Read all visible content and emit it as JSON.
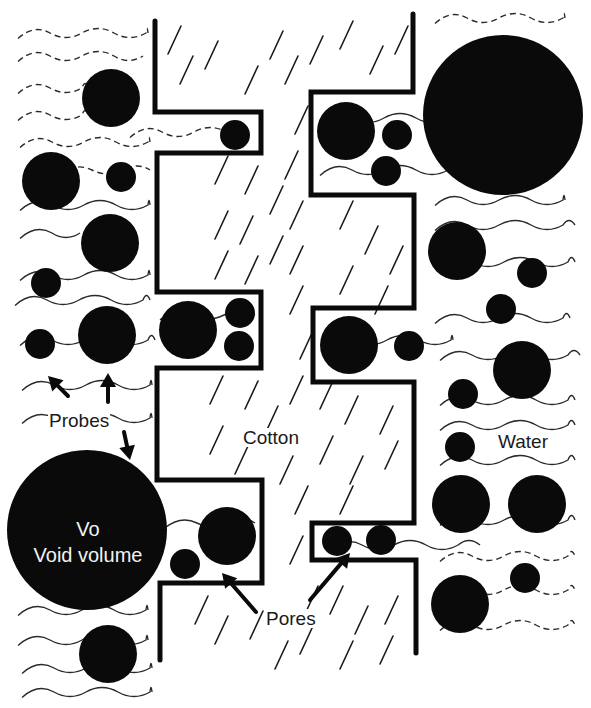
{
  "figure": {
    "width": 591,
    "height": 708,
    "background": "#ffffff",
    "ink_color": "#0a0a0a",
    "wave_color": "#2a2a2a",
    "hatch_color": "#1a1a1a"
  },
  "labels": {
    "probes": "Probes",
    "cotton": "Cotton",
    "water": "Water",
    "pores": "Pores",
    "void_title": "Vo",
    "void_subtitle": "Void volume"
  },
  "walls": [
    {
      "name": "left-cotton-wall",
      "points": [
        [
          155,
          21
        ],
        [
          155,
          112
        ],
        [
          261,
          112
        ],
        [
          261,
          153
        ],
        [
          157,
          153
        ],
        [
          157,
          292
        ],
        [
          261,
          292
        ],
        [
          261,
          368
        ],
        [
          157,
          368
        ],
        [
          157,
          480
        ],
        [
          262,
          480
        ],
        [
          262,
          583
        ],
        [
          160,
          583
        ],
        [
          160,
          660
        ]
      ]
    },
    {
      "name": "right-cotton-wall",
      "points": [
        [
          413,
          14
        ],
        [
          413,
          92
        ],
        [
          311,
          92
        ],
        [
          311,
          195
        ],
        [
          414,
          195
        ],
        [
          414,
          308
        ],
        [
          313,
          308
        ],
        [
          313,
          382
        ],
        [
          414,
          382
        ],
        [
          414,
          523
        ],
        [
          312,
          523
        ],
        [
          312,
          560
        ],
        [
          416,
          560
        ],
        [
          416,
          653
        ]
      ]
    }
  ],
  "circles": [
    {
      "cx": 111,
      "cy": 98,
      "r": 29,
      "region": "water-left"
    },
    {
      "cx": 51,
      "cy": 181,
      "r": 29,
      "region": "water-left"
    },
    {
      "cx": 121,
      "cy": 177,
      "r": 15,
      "region": "water-left"
    },
    {
      "cx": 110,
      "cy": 243,
      "r": 29,
      "region": "water-left"
    },
    {
      "cx": 46,
      "cy": 283,
      "r": 15,
      "region": "water-left"
    },
    {
      "cx": 40,
      "cy": 344,
      "r": 15,
      "region": "water-left"
    },
    {
      "cx": 107,
      "cy": 335,
      "r": 29,
      "region": "water-left"
    },
    {
      "cx": 87,
      "cy": 530,
      "r": 80,
      "region": "void-volume"
    },
    {
      "cx": 108,
      "cy": 654,
      "r": 29,
      "region": "water-left"
    },
    {
      "cx": 235,
      "cy": 135,
      "r": 15,
      "region": "pore-left-1"
    },
    {
      "cx": 188,
      "cy": 330,
      "r": 29,
      "region": "pore-left-2"
    },
    {
      "cx": 240,
      "cy": 313,
      "r": 15,
      "region": "pore-left-2"
    },
    {
      "cx": 239,
      "cy": 346,
      "r": 15,
      "region": "pore-left-2"
    },
    {
      "cx": 227,
      "cy": 536,
      "r": 29,
      "region": "pore-left-3"
    },
    {
      "cx": 185,
      "cy": 564,
      "r": 15,
      "region": "pore-left-3"
    },
    {
      "cx": 346,
      "cy": 131,
      "r": 29,
      "region": "pore-right-1"
    },
    {
      "cx": 397,
      "cy": 135,
      "r": 15,
      "region": "pore-right-1"
    },
    {
      "cx": 386,
      "cy": 171,
      "r": 15,
      "region": "pore-right-1"
    },
    {
      "cx": 349,
      "cy": 345,
      "r": 29,
      "region": "pore-right-2"
    },
    {
      "cx": 409,
      "cy": 346,
      "r": 15,
      "region": "pore-right-2"
    },
    {
      "cx": 337,
      "cy": 541,
      "r": 15,
      "region": "pore-right-3"
    },
    {
      "cx": 381,
      "cy": 540,
      "r": 15,
      "region": "pore-right-3"
    },
    {
      "cx": 503,
      "cy": 115,
      "r": 80,
      "region": "water-right"
    },
    {
      "cx": 457,
      "cy": 251,
      "r": 29,
      "region": "water-right"
    },
    {
      "cx": 532,
      "cy": 273,
      "r": 15,
      "region": "water-right"
    },
    {
      "cx": 501,
      "cy": 309,
      "r": 15,
      "region": "water-right"
    },
    {
      "cx": 522,
      "cy": 370,
      "r": 29,
      "region": "water-right"
    },
    {
      "cx": 463,
      "cy": 394,
      "r": 15,
      "region": "water-right"
    },
    {
      "cx": 460,
      "cy": 447,
      "r": 15,
      "region": "water-right"
    },
    {
      "cx": 461,
      "cy": 504,
      "r": 29,
      "region": "water-right"
    },
    {
      "cx": 537,
      "cy": 504,
      "r": 29,
      "region": "water-right"
    },
    {
      "cx": 525,
      "cy": 578,
      "r": 15,
      "region": "water-right"
    },
    {
      "cx": 460,
      "cy": 604,
      "r": 29,
      "region": "water-right"
    }
  ],
  "waves": [
    {
      "x": 18,
      "y": 33,
      "len": 130,
      "amp": 9,
      "dash": true
    },
    {
      "x": 18,
      "y": 56,
      "len": 125,
      "amp": 9,
      "dash": true
    },
    {
      "x": 18,
      "y": 88,
      "len": 70,
      "amp": 9,
      "dash": true
    },
    {
      "x": 18,
      "y": 115,
      "len": 70,
      "amp": 9,
      "dash": true
    },
    {
      "x": 20,
      "y": 142,
      "len": 130,
      "amp": 9,
      "dash": true
    },
    {
      "x": 60,
      "y": 170,
      "len": 90,
      "amp": 8,
      "dash": true
    },
    {
      "x": 20,
      "y": 205,
      "len": 130,
      "amp": 9,
      "dash": false
    },
    {
      "x": 20,
      "y": 233,
      "len": 60,
      "amp": 9,
      "dash": false
    },
    {
      "x": 20,
      "y": 275,
      "len": 130,
      "amp": 9,
      "dash": false
    },
    {
      "x": 15,
      "y": 300,
      "len": 135,
      "amp": 9,
      "dash": false
    },
    {
      "x": 20,
      "y": 340,
      "len": 135,
      "amp": 9,
      "dash": false
    },
    {
      "x": 22,
      "y": 385,
      "len": 130,
      "amp": 9,
      "dash": false
    },
    {
      "x": 22,
      "y": 418,
      "len": 130,
      "amp": 9,
      "dash": false
    },
    {
      "x": 18,
      "y": 610,
      "len": 130,
      "amp": 9,
      "dash": false
    },
    {
      "x": 18,
      "y": 640,
      "len": 130,
      "amp": 9,
      "dash": false
    },
    {
      "x": 22,
      "y": 668,
      "len": 130,
      "amp": 9,
      "dash": false
    },
    {
      "x": 22,
      "y": 692,
      "len": 130,
      "amp": 9,
      "dash": false
    },
    {
      "x": 130,
      "y": 132,
      "len": 120,
      "amp": 9,
      "dash": true
    },
    {
      "x": 160,
      "y": 315,
      "len": 95,
      "amp": 8,
      "dash": false
    },
    {
      "x": 165,
      "y": 523,
      "len": 90,
      "amp": 8,
      "dash": false
    },
    {
      "x": 320,
      "y": 118,
      "len": 130,
      "amp": 9,
      "dash": false
    },
    {
      "x": 320,
      "y": 170,
      "len": 130,
      "amp": 9,
      "dash": false
    },
    {
      "x": 323,
      "y": 340,
      "len": 130,
      "amp": 9,
      "dash": false
    },
    {
      "x": 330,
      "y": 545,
      "len": 150,
      "amp": 9,
      "dash": false
    },
    {
      "x": 435,
      "y": 18,
      "len": 130,
      "amp": 9,
      "dash": true
    },
    {
      "x": 435,
      "y": 200,
      "len": 130,
      "amp": 9,
      "dash": false
    },
    {
      "x": 435,
      "y": 225,
      "len": 140,
      "amp": 9,
      "dash": false
    },
    {
      "x": 440,
      "y": 262,
      "len": 135,
      "amp": 9,
      "dash": false
    },
    {
      "x": 435,
      "y": 318,
      "len": 135,
      "amp": 9,
      "dash": false
    },
    {
      "x": 440,
      "y": 355,
      "len": 140,
      "amp": 9,
      "dash": false
    },
    {
      "x": 440,
      "y": 400,
      "len": 135,
      "amp": 9,
      "dash": false
    },
    {
      "x": 440,
      "y": 425,
      "len": 135,
      "amp": 9,
      "dash": false
    },
    {
      "x": 440,
      "y": 460,
      "len": 135,
      "amp": 9,
      "dash": false
    },
    {
      "x": 440,
      "y": 520,
      "len": 135,
      "amp": 9,
      "dash": false
    },
    {
      "x": 440,
      "y": 556,
      "len": 135,
      "amp": 9,
      "dash": true
    },
    {
      "x": 440,
      "y": 590,
      "len": 135,
      "amp": 9,
      "dash": true
    },
    {
      "x": 440,
      "y": 625,
      "len": 135,
      "amp": 9,
      "dash": true
    }
  ],
  "hatches": [
    [
      168,
      40
    ],
    [
      180,
      70
    ],
    [
      205,
      55
    ],
    [
      245,
      80
    ],
    [
      270,
      45
    ],
    [
      285,
      70
    ],
    [
      310,
      50
    ],
    [
      340,
      35
    ],
    [
      370,
      60
    ],
    [
      395,
      40
    ],
    [
      215,
      170
    ],
    [
      245,
      180
    ],
    [
      270,
      200
    ],
    [
      215,
      225
    ],
    [
      240,
      230
    ],
    [
      270,
      250
    ],
    [
      215,
      265
    ],
    [
      245,
      270
    ],
    [
      295,
      120
    ],
    [
      285,
      165
    ],
    [
      290,
      215
    ],
    [
      290,
      260
    ],
    [
      290,
      300
    ],
    [
      300,
      345
    ],
    [
      290,
      390
    ],
    [
      340,
      215
    ],
    [
      365,
      240
    ],
    [
      390,
      260
    ],
    [
      340,
      280
    ],
    [
      375,
      300
    ],
    [
      210,
      390
    ],
    [
      245,
      395
    ],
    [
      265,
      420
    ],
    [
      210,
      440
    ],
    [
      235,
      460
    ],
    [
      280,
      470
    ],
    [
      320,
      395
    ],
    [
      345,
      410
    ],
    [
      380,
      420
    ],
    [
      320,
      450
    ],
    [
      350,
      470
    ],
    [
      385,
      455
    ],
    [
      340,
      500
    ],
    [
      295,
      500
    ],
    [
      290,
      550
    ],
    [
      305,
      600
    ],
    [
      300,
      640
    ],
    [
      195,
      610
    ],
    [
      215,
      630
    ],
    [
      250,
      625
    ],
    [
      275,
      655
    ],
    [
      330,
      600
    ],
    [
      355,
      620
    ],
    [
      385,
      610
    ],
    [
      340,
      655
    ],
    [
      380,
      650
    ]
  ],
  "arrows": [
    {
      "from": [
        68,
        396
      ],
      "to": [
        48,
        376
      ],
      "name": "probe-arrow-1"
    },
    {
      "from": [
        108,
        402
      ],
      "to": [
        108,
        373
      ],
      "name": "probe-arrow-2"
    },
    {
      "from": [
        124,
        432
      ],
      "to": [
        130,
        460
      ],
      "name": "probe-arrow-3"
    },
    {
      "from": [
        256,
        612
      ],
      "to": [
        222,
        573
      ],
      "name": "pore-arrow-left"
    },
    {
      "from": [
        310,
        600
      ],
      "to": [
        350,
        553
      ],
      "name": "pore-arrow-right"
    }
  ],
  "label_positions": {
    "probes": [
      48,
      411
    ],
    "cotton": [
      242,
      428
    ],
    "water": [
      497,
      432
    ],
    "pores": [
      265,
      609
    ],
    "void": [
      17,
      516
    ]
  }
}
